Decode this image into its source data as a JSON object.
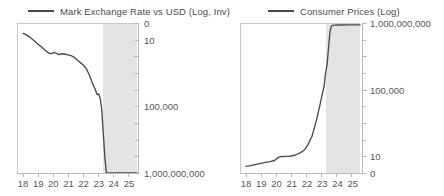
{
  "chart_data": [
    {
      "type": "line",
      "title": "",
      "legend": [
        {
          "name": "Mark Exchange Rate vs USD (Log, Inv)",
          "color": "#4a4a4c"
        }
      ],
      "legend_position": "top",
      "xlabel": "",
      "ylabel": "",
      "x_ticklabels": [
        "18",
        "19",
        "20",
        "21",
        "22",
        "23",
        "24",
        "25"
      ],
      "x": [
        18,
        19,
        20,
        21,
        22,
        23,
        24,
        25
      ],
      "xlim": [
        17.6,
        25.6
      ],
      "y_ticklabels": [
        "0",
        "10",
        "100,000",
        "1,000,000,000"
      ],
      "y_tickvalues": [
        0,
        10,
        100000,
        1000000000
      ],
      "ylim": [
        0,
        1000000000
      ],
      "y_inverted": true,
      "y_scale": "log",
      "grid": false,
      "axis_side": "right",
      "shaded_region": {
        "x_start": 23.5,
        "x_end": 25.6,
        "color": "#e4e4e4"
      },
      "series": [
        {
          "name": "Mark Exchange Rate vs USD (Log, Inv)",
          "x": [
            18.0,
            18.2,
            18.45,
            18.7,
            18.95,
            19.2,
            19.45,
            19.7,
            19.9,
            20.05,
            20.2,
            20.4,
            20.6,
            20.8,
            21.0,
            21.2,
            21.4,
            21.6,
            21.8,
            22.0,
            22.2,
            22.4,
            22.6,
            22.8,
            22.95,
            23.05,
            23.15,
            23.25,
            23.35,
            23.45,
            23.55,
            23.62,
            23.7,
            23.8,
            24.0,
            24.5,
            25.0,
            25.6
          ],
          "values": [
            4.2,
            5.0,
            7.0,
            11.0,
            17.0,
            26.0,
            42.0,
            62.0,
            70.0,
            58.0,
            65.0,
            78.0,
            70.0,
            75.0,
            82.0,
            90.0,
            110.0,
            160.0,
            230.0,
            320.0,
            500.0,
            1200.0,
            3500.0,
            9000.0,
            20000.0,
            18000.0,
            35000.0,
            150000.0,
            4000000.0,
            90000000.0,
            900000000.0,
            1000000000.0,
            1000000000.0,
            1000000000.0,
            1000000000.0,
            1000000000.0,
            1000000000.0,
            1000000000.0
          ]
        }
      ]
    },
    {
      "type": "line",
      "title": "",
      "legend": [
        {
          "name": "Consumer Prices (Log)",
          "color": "#4a4a4c"
        }
      ],
      "legend_position": "top",
      "xlabel": "",
      "ylabel": "",
      "x_ticklabels": [
        "18",
        "19",
        "20",
        "21",
        "22",
        "23",
        "24",
        "25"
      ],
      "x": [
        18,
        19,
        20,
        21,
        22,
        23,
        24,
        25
      ],
      "xlim": [
        17.6,
        25.6
      ],
      "y_ticklabels": [
        "1,000,000,000",
        "100,000",
        "10",
        "0"
      ],
      "y_tickvalues": [
        1000000000,
        100000,
        10,
        0
      ],
      "ylim": [
        0,
        1000000000
      ],
      "y_inverted": false,
      "y_scale": "log",
      "grid": false,
      "axis_side": "right",
      "shaded_region": {
        "x_start": 23.5,
        "x_end": 25.6,
        "color": "#e4e4e4"
      },
      "series": [
        {
          "name": "Consumer Prices (Log)",
          "x": [
            18.0,
            18.3,
            18.6,
            19.0,
            19.3,
            19.6,
            19.9,
            20.1,
            20.3,
            20.5,
            20.8,
            21.0,
            21.3,
            21.6,
            21.9,
            22.1,
            22.4,
            22.7,
            22.9,
            23.05,
            23.2,
            23.3,
            23.4,
            23.5,
            23.6,
            23.7,
            23.9,
            24.2,
            24.8,
            25.6
          ],
          "values": [
            2.5,
            2.8,
            3.2,
            3.8,
            4.3,
            4.8,
            5.6,
            8.0,
            9.5,
            9.8,
            10.0,
            10.5,
            12.0,
            16.0,
            24.0,
            45.0,
            160.0,
            1500.0,
            9000.0,
            40000.0,
            150000.0,
            900000.0,
            3000000.0,
            30000000.0,
            300000000.0,
            700000000.0,
            750000000.0,
            760000000.0,
            770000000.0,
            780000000.0
          ]
        }
      ]
    }
  ],
  "panels": [
    {
      "legend_label": "Mark Exchange Rate vs USD (Log, Inv)",
      "x_ticklabels": [
        "18",
        "19",
        "20",
        "21",
        "22",
        "23",
        "24",
        "25"
      ],
      "y_ticklabels": [
        "0",
        "10",
        "100,000",
        "1,000,000,000"
      ]
    },
    {
      "legend_label": "Consumer Prices (Log)",
      "x_ticklabels": [
        "18",
        "19",
        "20",
        "21",
        "22",
        "23",
        "24",
        "25"
      ],
      "y_ticklabels": [
        "1,000,000,000",
        "100,000",
        "10",
        "0"
      ]
    }
  ],
  "colors": {
    "line": "#4a4a4c",
    "shaded_band": "#e4e4e4",
    "axis": "#b9b9bb",
    "text": "#58585a"
  }
}
